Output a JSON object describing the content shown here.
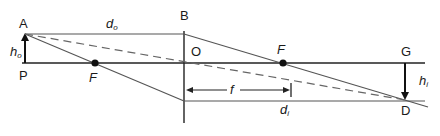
{
  "diagram": {
    "type": "thin-lens-ray-diagram",
    "colors": {
      "line": "#222222",
      "ray": "#555555",
      "dashed_ray": "#666666",
      "background": "#ffffff"
    },
    "labels": {
      "A": "A",
      "B": "B",
      "P": "P",
      "O": "O",
      "F_left": "F",
      "F_right": "F",
      "G": "G",
      "D": "D",
      "h_o_base": "h",
      "h_o_sub": "o",
      "d_o_base": "d",
      "d_o_sub": "o",
      "f": "f",
      "d_i_base": "d",
      "d_i_sub": "i",
      "h_i_base": "h",
      "h_i_sub": "i"
    }
  }
}
